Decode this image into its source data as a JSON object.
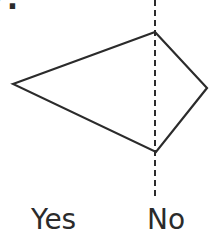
{
  "question": {
    "number_fragment": "7."
  },
  "diagram": {
    "shape": "kite-quadrilateral",
    "vertices": {
      "left": [
        13,
        84
      ],
      "top": [
        155,
        32
      ],
      "right": [
        207,
        88
      ],
      "bottom": [
        156,
        152
      ]
    },
    "divider": {
      "style": "dashed",
      "x": 155,
      "y_start": 0,
      "y_end": 198
    },
    "stroke_color": "#2b2b2b"
  },
  "labels": {
    "left": "Yes",
    "right": "No"
  }
}
